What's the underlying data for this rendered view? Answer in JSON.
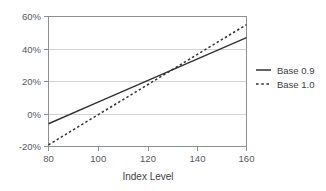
{
  "chart_data": {
    "type": "line",
    "title": "",
    "xlabel": "Index Level",
    "ylabel": "",
    "xlim": [
      80,
      160
    ],
    "ylim": [
      -20,
      60
    ],
    "grid": true,
    "legend_position": "right",
    "x_ticks": [
      80,
      100,
      120,
      140,
      160
    ],
    "x_tick_labels": [
      "80",
      "100",
      "120",
      "140",
      "160"
    ],
    "y_ticks": [
      -20,
      0,
      20,
      40,
      60
    ],
    "y_tick_labels": [
      "-20%",
      "0%",
      "20%",
      "40%",
      "60%"
    ],
    "x": [
      80,
      100,
      120,
      140,
      160
    ],
    "series": [
      {
        "name": "Base 0.9",
        "style": "solid",
        "color": "#2f3133",
        "values": [
          -6,
          7.3,
          20.6,
          33.8,
          47
        ]
      },
      {
        "name": "Base 1.0",
        "style": "dashed",
        "color": "#2f3133",
        "values": [
          -19,
          -0.5,
          18,
          36.5,
          55
        ]
      }
    ]
  },
  "axes": {
    "x_title": "Index Level",
    "x_tick_labels": [
      "80",
      "100",
      "120",
      "140",
      "160"
    ],
    "y_tick_labels": [
      "60%",
      "40%",
      "20%",
      "0%",
      "-20%"
    ]
  },
  "legend": {
    "entries": [
      {
        "label": "Base 0.9",
        "style": "solid"
      },
      {
        "label": "Base 1.0",
        "style": "dashed"
      }
    ]
  },
  "colors": {
    "background": "#ffffff",
    "series": "#2f3133",
    "grid": "#c8c8c8",
    "frame": "#8d9093",
    "text": "#3d4043"
  }
}
